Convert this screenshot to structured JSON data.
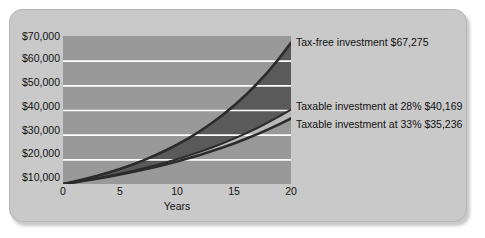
{
  "chart_data": {
    "type": "area",
    "title": "",
    "xlabel": "Years",
    "ylabel": "",
    "xlim": [
      0,
      20
    ],
    "ylim": [
      10000,
      70000
    ],
    "grid": true,
    "legend_position": "right-inline-annotations",
    "x": [
      0,
      1,
      2,
      3,
      4,
      5,
      6,
      7,
      8,
      9,
      10,
      11,
      12,
      13,
      14,
      15,
      16,
      17,
      18,
      19,
      20
    ],
    "xticks": [
      "0",
      "5",
      "10",
      "15",
      "20"
    ],
    "xtick_values": [
      0,
      5,
      10,
      15,
      20
    ],
    "yticks": [
      "$10,000",
      "$20,000",
      "$30,000",
      "$40,000",
      "$50,000",
      "$60,000",
      "$70,000"
    ],
    "ytick_values": [
      10000,
      20000,
      30000,
      40000,
      50000,
      60000,
      70000
    ],
    "series": [
      {
        "name": "Tax-free investment",
        "end_value": 67275,
        "end_value_label": "$67,275",
        "annotation": "Tax-free investment $67,275",
        "color": "#4c4c4c",
        "values": [
          10000,
          11000,
          12100,
          13310,
          14641,
          16105,
          17716,
          19487,
          21436,
          23579,
          25937,
          28531,
          31384,
          34523,
          37975,
          41772,
          45950,
          50545,
          55599,
          61159,
          67275
        ]
      },
      {
        "name": "Taxable investment at 28%",
        "end_value": 40169,
        "end_value_label": "$40,169",
        "annotation": "Taxable investment at 28% $40,169",
        "color": "#707070",
        "values": [
          10000,
          10720,
          11492,
          12319,
          13206,
          14157,
          15176,
          16269,
          17440,
          18696,
          20042,
          21485,
          23032,
          24690,
          26467,
          28373,
          30416,
          32606,
          34954,
          37471,
          40169
        ]
      },
      {
        "name": "Taxable investment at 33%",
        "end_value": 35236,
        "end_value_label": "$35,236",
        "annotation": "Taxable investment at 33% $35,236",
        "color": "#3a3a3a",
        "values": [
          10000,
          10670,
          11385,
          12148,
          12962,
          13830,
          14757,
          15745,
          16800,
          17926,
          19127,
          20408,
          21776,
          23235,
          24792,
          26453,
          28225,
          30116,
          32134,
          34287,
          36584
        ]
      }
    ],
    "colors": {
      "panel_background": "#c9c9c9",
      "plot_background": "#999999",
      "gridline": "#ffffff",
      "band_taxfree_to_taxable": "#5a5a5a",
      "band_between_taxables": "#b9b9b9",
      "curve_dark": "#2b2b2b",
      "text": "#111111"
    }
  },
  "axis": {
    "y_labels": [
      "$70,000",
      "$60,000",
      "$50,000",
      "$40,000",
      "$30,000",
      "$20,000",
      "$10,000"
    ],
    "x_labels": [
      "0",
      "5",
      "10",
      "15",
      "20"
    ],
    "x_title": "Years"
  },
  "annotations": {
    "taxfree": "Tax-free investment $67,275",
    "taxable28": "Taxable investment at 28% $40,169",
    "taxable33": "Taxable investment at 33% $35,236"
  }
}
